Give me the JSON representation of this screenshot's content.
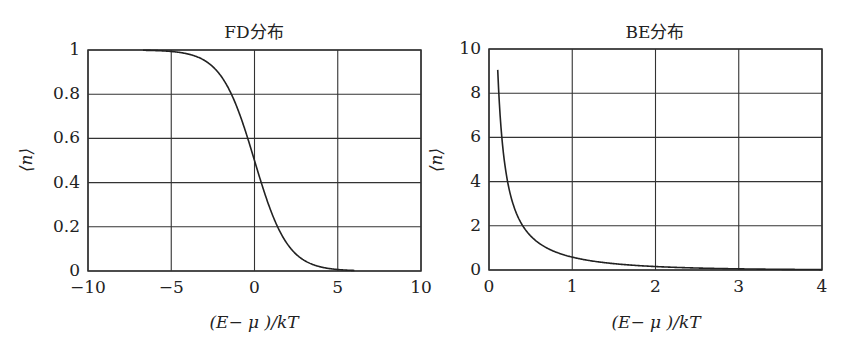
{
  "chart_data": [
    {
      "type": "line",
      "title": "FD分布",
      "xlabel": "(E− μ )/kT",
      "ylabel": "⟨n⟩",
      "xlim": [
        -10,
        10
      ],
      "ylim": [
        0,
        1
      ],
      "xticks": [
        "−10",
        "−5",
        "0",
        "5",
        "10"
      ],
      "yticks": [
        "0",
        "0.2",
        "0.4",
        "0.6",
        "0.8",
        "1"
      ],
      "grid": true,
      "legend": null,
      "series": [
        {
          "name": "Fermi-Dirac",
          "formula": "1/(exp(x)+1)",
          "x": [
            -6.7,
            -5,
            -4,
            -3,
            -2,
            -1,
            -0.5,
            0,
            0.5,
            1,
            1.5,
            2,
            3,
            4,
            5,
            6
          ],
          "y": [
            1.0,
            0.993,
            0.982,
            0.953,
            0.881,
            0.731,
            0.622,
            0.5,
            0.378,
            0.269,
            0.182,
            0.119,
            0.047,
            0.018,
            0.007,
            0.002
          ]
        }
      ]
    },
    {
      "type": "line",
      "title": "BE分布",
      "xlabel": "(E− μ )/kT",
      "ylabel": "⟨n⟩",
      "xlim": [
        0,
        4
      ],
      "ylim": [
        0,
        10
      ],
      "xticks": [
        "0",
        "1",
        "2",
        "3",
        "4"
      ],
      "yticks": [
        "0",
        "2",
        "4",
        "6",
        "8",
        "10"
      ],
      "grid": true,
      "legend": null,
      "series": [
        {
          "name": "Bose-Einstein",
          "formula": "1/(exp(x)-1)",
          "x": [
            0.095,
            0.12,
            0.15,
            0.2,
            0.25,
            0.3,
            0.4,
            0.5,
            0.7,
            1.0,
            1.5,
            2.0,
            2.5,
            3.0,
            3.5,
            4.0
          ],
          "y": [
            10.0,
            7.84,
            6.18,
            4.52,
            3.52,
            2.86,
            2.03,
            1.54,
            0.99,
            0.58,
            0.29,
            0.16,
            0.09,
            0.05,
            0.03,
            0.02
          ]
        }
      ]
    }
  ]
}
